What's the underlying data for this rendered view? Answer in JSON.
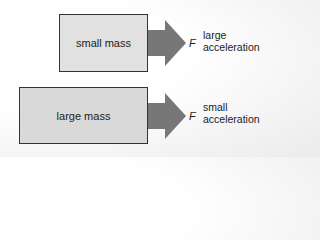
{
  "diagram": {
    "title": "",
    "colors": {
      "arrow": "#777777",
      "box_fill": "#e0e0e0",
      "box_border": "#333333"
    },
    "rows": [
      {
        "mass_label": "small mass",
        "force_label": "F",
        "result_line1": "large",
        "result_line2": "acceleration"
      },
      {
        "mass_label": "large mass",
        "force_label": "F",
        "result_line1": "small",
        "result_line2": "acceleration"
      }
    ]
  }
}
